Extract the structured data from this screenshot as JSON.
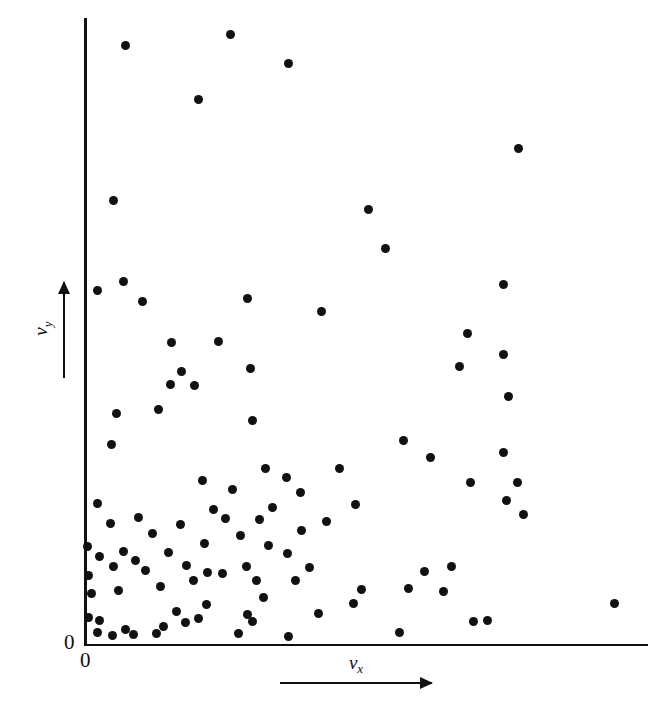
{
  "chart_data": {
    "type": "scatter",
    "title": "",
    "subtitle": "",
    "xlabel": "v_x",
    "ylabel": "v_y",
    "xlabel_base": "v",
    "xlabel_sub": "x",
    "ylabel_base": "v",
    "ylabel_sub": "y",
    "grid": false,
    "legend": null,
    "legend_position": "none",
    "xlim": [
      0,
      1
    ],
    "ylim": [
      0,
      1
    ],
    "x_tick_labels": [
      "0"
    ],
    "y_tick_labels": [
      "0"
    ],
    "origin_label_x": "0",
    "origin_label_y": "0",
    "x_axis_arrow": true,
    "y_axis_arrow": true,
    "marker": "filled-circle",
    "marker_color": "#111111",
    "marker_size_px": 9,
    "n_points": 104,
    "annotation": "Scatter of molecular velocity components; each dot is one molecule's (v_x, v_y).",
    "points_px": [
      [
        125,
        45
      ],
      [
        230,
        34
      ],
      [
        288,
        63
      ],
      [
        198,
        99
      ],
      [
        518,
        148
      ],
      [
        113,
        200
      ],
      [
        368,
        209
      ],
      [
        385,
        248
      ],
      [
        97,
        290
      ],
      [
        123,
        281
      ],
      [
        142,
        301
      ],
      [
        247,
        298
      ],
      [
        321,
        311
      ],
      [
        171,
        342
      ],
      [
        218,
        341
      ],
      [
        467,
        333
      ],
      [
        181,
        371
      ],
      [
        170,
        384
      ],
      [
        503,
        354
      ],
      [
        459,
        366
      ],
      [
        116,
        413
      ],
      [
        158,
        409
      ],
      [
        503,
        284
      ],
      [
        508,
        396
      ],
      [
        111,
        444
      ],
      [
        194,
        385
      ],
      [
        250,
        368
      ],
      [
        252,
        420
      ],
      [
        265,
        468
      ],
      [
        286,
        477
      ],
      [
        202,
        480
      ],
      [
        232,
        489
      ],
      [
        339,
        468
      ],
      [
        300,
        492
      ],
      [
        355,
        504
      ],
      [
        403,
        440
      ],
      [
        430,
        457
      ],
      [
        503,
        452
      ],
      [
        470,
        482
      ],
      [
        517,
        482
      ],
      [
        506,
        500
      ],
      [
        523,
        514
      ],
      [
        97,
        503
      ],
      [
        138,
        517
      ],
      [
        110,
        523
      ],
      [
        152,
        533
      ],
      [
        180,
        524
      ],
      [
        168,
        552
      ],
      [
        213,
        509
      ],
      [
        225,
        518
      ],
      [
        204,
        543
      ],
      [
        240,
        535
      ],
      [
        259,
        519
      ],
      [
        272,
        507
      ],
      [
        301,
        530
      ],
      [
        326,
        521
      ],
      [
        87,
        546
      ],
      [
        99,
        556
      ],
      [
        123,
        551
      ],
      [
        135,
        560
      ],
      [
        88,
        575
      ],
      [
        113,
        566
      ],
      [
        145,
        570
      ],
      [
        91,
        593
      ],
      [
        118,
        590
      ],
      [
        160,
        586
      ],
      [
        186,
        565
      ],
      [
        193,
        580
      ],
      [
        207,
        572
      ],
      [
        222,
        573
      ],
      [
        246,
        566
      ],
      [
        256,
        580
      ],
      [
        268,
        545
      ],
      [
        287,
        553
      ],
      [
        309,
        567
      ],
      [
        295,
        580
      ],
      [
        88,
        617
      ],
      [
        99,
        620
      ],
      [
        97,
        632
      ],
      [
        112,
        635
      ],
      [
        125,
        629
      ],
      [
        133,
        634
      ],
      [
        156,
        633
      ],
      [
        163,
        626
      ],
      [
        176,
        611
      ],
      [
        185,
        622
      ],
      [
        198,
        618
      ],
      [
        206,
        604
      ],
      [
        238,
        633
      ],
      [
        247,
        614
      ],
      [
        263,
        597
      ],
      [
        252,
        621
      ],
      [
        288,
        636
      ],
      [
        318,
        613
      ],
      [
        353,
        603
      ],
      [
        361,
        589
      ],
      [
        399,
        632
      ],
      [
        408,
        588
      ],
      [
        424,
        571
      ],
      [
        443,
        591
      ],
      [
        451,
        566
      ],
      [
        473,
        621
      ],
      [
        487,
        620
      ],
      [
        614,
        603
      ]
    ],
    "axis_geometry": {
      "origin_px": [
        84,
        644
      ],
      "x_axis_end_px": [
        648,
        644
      ],
      "y_axis_top_px": [
        84,
        18
      ]
    }
  }
}
